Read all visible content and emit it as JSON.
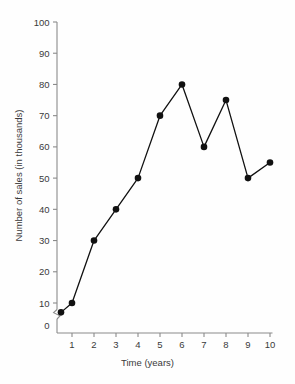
{
  "chart_data": {
    "type": "line",
    "title": "",
    "xlabel": "Time (years)",
    "ylabel": "Number of sales (in thousands)",
    "xlim": [
      0,
      10.4
    ],
    "ylim": [
      0,
      100
    ],
    "grid": false,
    "legend": null,
    "y_axis_break": true,
    "y_axis_break_between": [
      0,
      10
    ],
    "xticks": [
      1,
      2,
      3,
      4,
      5,
      6,
      7,
      8,
      9,
      10
    ],
    "xtick_labels": [
      "1",
      "2",
      "3",
      "4",
      "5",
      "6",
      "7",
      "8",
      "9",
      "10"
    ],
    "yticks": [
      0,
      10,
      20,
      30,
      40,
      50,
      60,
      70,
      80,
      90,
      100
    ],
    "ytick_labels": [
      "0",
      "10",
      "20",
      "30",
      "40",
      "50",
      "60",
      "70",
      "80",
      "90",
      "100"
    ],
    "x": [
      0.5,
      1,
      2,
      3,
      4,
      5,
      6,
      7,
      8,
      9,
      10
    ],
    "values": [
      7,
      10,
      30,
      40,
      50,
      70,
      80,
      60,
      75,
      50,
      55
    ],
    "series": [
      {
        "name": "Number of sales",
        "x": [
          0.5,
          1,
          2,
          3,
          4,
          5,
          6,
          7,
          8,
          9,
          10
        ],
        "values": [
          7,
          10,
          30,
          40,
          50,
          70,
          80,
          60,
          75,
          50,
          55
        ]
      }
    ],
    "marker": "filled-circle",
    "line_color": "#111111",
    "marker_color": "#111111",
    "axis_color": "#8a8a8a",
    "text_color": "#3a3a3a",
    "background_color": "#fefefe"
  }
}
